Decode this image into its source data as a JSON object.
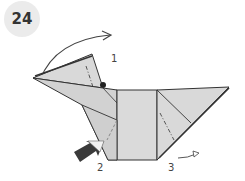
{
  "step": {
    "number": "24"
  },
  "labels": [
    {
      "id": "1",
      "text": "1"
    },
    {
      "id": "2",
      "text": "2"
    },
    {
      "id": "3",
      "text": "3"
    }
  ],
  "colors": {
    "paper": "#d9d9d9",
    "line": "#333333",
    "badge": "#ebebeb",
    "arrow_dark": "#333333"
  }
}
